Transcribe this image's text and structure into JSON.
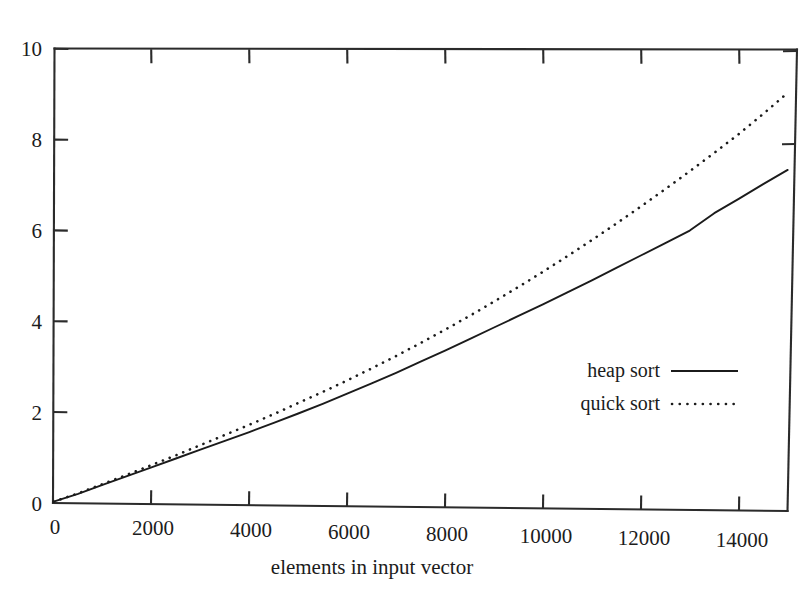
{
  "chart_data": {
    "type": "line",
    "title": "",
    "subtitle": "",
    "xlabel": "elements in input vector",
    "ylabel": "",
    "xlim": [
      0,
      15000
    ],
    "ylim": [
      0,
      10
    ],
    "grid": false,
    "legend_position": "center-right-inside",
    "x_ticks": [
      0,
      2000,
      4000,
      6000,
      8000,
      10000,
      12000,
      14000
    ],
    "x_tick_labels": [
      "0",
      "2000",
      "4000",
      "6000",
      "8000",
      "10000",
      "12000",
      "14000"
    ],
    "y_ticks": [
      0,
      2,
      4,
      6,
      8,
      10
    ],
    "y_tick_labels": [
      "0",
      "2",
      "4",
      "6",
      "8",
      "10"
    ],
    "x": [
      0,
      500,
      1000,
      1500,
      2000,
      2500,
      3000,
      3500,
      4000,
      4500,
      5000,
      5500,
      6000,
      6500,
      7000,
      7500,
      8000,
      8500,
      9000,
      9500,
      10000,
      10500,
      11000,
      11500,
      12000,
      12500,
      13000,
      13500,
      14000,
      14500,
      15000
    ],
    "series": [
      {
        "name": "heap sort",
        "style": "solid",
        "values": [
          0.02,
          0.2,
          0.4,
          0.6,
          0.8,
          1.0,
          1.2,
          1.4,
          1.6,
          1.81,
          2.02,
          2.24,
          2.47,
          2.7,
          2.94,
          3.19,
          3.44,
          3.7,
          3.96,
          4.22,
          4.48,
          4.75,
          5.02,
          5.3,
          5.58,
          5.86,
          6.14,
          6.53,
          6.85,
          7.18,
          7.5
        ]
      },
      {
        "name": "quick sort",
        "style": "dotted",
        "values": [
          0.02,
          0.21,
          0.42,
          0.63,
          0.85,
          1.07,
          1.3,
          1.53,
          1.76,
          2.0,
          2.25,
          2.5,
          2.76,
          3.03,
          3.31,
          3.6,
          3.9,
          4.21,
          4.53,
          4.86,
          5.2,
          5.55,
          5.91,
          6.28,
          6.66,
          7.05,
          7.45,
          7.86,
          8.28,
          8.73,
          9.2
        ]
      }
    ],
    "legend_entries": [
      {
        "label": "heap sort",
        "style": "solid"
      },
      {
        "label": "quick sort",
        "style": "dotted"
      }
    ],
    "colors": {
      "heap_sort": "#1b1b1b",
      "quick_sort": "#1b1b1b",
      "axis": "#2b2b2b",
      "background": "#ffffff"
    }
  }
}
